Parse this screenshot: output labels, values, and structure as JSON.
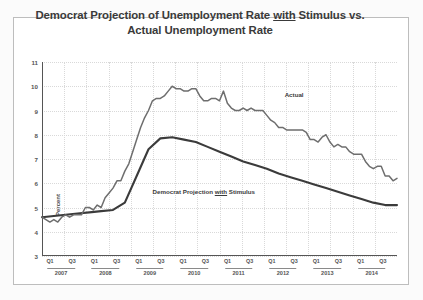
{
  "title_parts": {
    "before": "Democrat Projection of Unemployment Rate ",
    "underlined": "with",
    "after": " Stimulus vs.",
    "line2": "Actual Unemployment Rate"
  },
  "labels": {
    "actual": "Actual",
    "projection_before": "Democrat Projection ",
    "projection_underlined": "with",
    "projection_after": " Stimulus"
  },
  "colors": {
    "actual_line": "#6e6e6e",
    "projection_line": "#3b3b3b",
    "axis": "#555555",
    "grid": "#d9d9d9",
    "frame": "#bdbdbd",
    "title_text": "#3a3a3a",
    "page_background": "#fbfbfb",
    "plot_background": "#ffffff"
  },
  "chart_data": {
    "type": "line",
    "title": "Democrat Projection of Unemployment Rate with Stimulus vs. Actual Unemployment Rate",
    "xlabel": "",
    "ylabel": "Percent",
    "ylim": [
      3,
      11
    ],
    "yticks": [
      3,
      4,
      5,
      6,
      7,
      8,
      9,
      10,
      11
    ],
    "grid": true,
    "legend": "inline-annotations",
    "years": [
      "2007",
      "2008",
      "2009",
      "2010",
      "2011",
      "2012",
      "2013",
      "2014"
    ],
    "quarter_ticks": [
      "Q1",
      "Q3",
      "Q1",
      "Q3",
      "Q1",
      "Q3",
      "Q1",
      "Q3",
      "Q1",
      "Q3",
      "Q1",
      "Q3",
      "Q1",
      "Q3",
      "Q1",
      "Q3"
    ],
    "x": [
      "2007Q1",
      "2007Q2",
      "2007Q3",
      "2007Q4",
      "2008Q1",
      "2008Q2",
      "2008Q3",
      "2008Q4",
      "2009Q1",
      "2009Q2",
      "2009Q3",
      "2009Q4",
      "2010Q1",
      "2010Q2",
      "2010Q3",
      "2010Q4",
      "2011Q1",
      "2011Q2",
      "2011Q3",
      "2011Q4",
      "2012Q1",
      "2012Q2",
      "2012Q3",
      "2012Q4",
      "2013Q1",
      "2013Q2",
      "2013Q3",
      "2013Q4",
      "2014Q1",
      "2014Q2",
      "2014Q3"
    ],
    "series": [
      {
        "name": "Actual",
        "color": "#6e6e6e",
        "monthly_values": [
          4.6,
          4.5,
          4.4,
          4.5,
          4.4,
          4.6,
          4.7,
          4.6,
          4.7,
          4.7,
          4.7,
          5.0,
          5.0,
          4.9,
          5.1,
          5.0,
          5.4,
          5.6,
          5.8,
          6.1,
          6.1,
          6.5,
          6.8,
          7.3,
          7.8,
          8.3,
          8.7,
          9.0,
          9.4,
          9.5,
          9.5,
          9.6,
          9.8,
          10.0,
          9.9,
          9.9,
          9.8,
          9.8,
          9.9,
          9.9,
          9.6,
          9.4,
          9.4,
          9.5,
          9.5,
          9.4,
          9.8,
          9.3,
          9.1,
          9.0,
          9.0,
          9.1,
          9.0,
          9.1,
          9.0,
          9.0,
          9.0,
          8.8,
          8.6,
          8.5,
          8.3,
          8.3,
          8.2,
          8.2,
          8.2,
          8.2,
          8.2,
          8.1,
          7.8,
          7.8,
          7.7,
          7.9,
          8.0,
          7.7,
          7.5,
          7.6,
          7.5,
          7.5,
          7.3,
          7.2,
          7.2,
          7.2,
          6.9,
          6.7,
          6.6,
          6.7,
          6.7,
          6.3,
          6.3,
          6.1,
          6.2
        ]
      },
      {
        "name": "Democrat Projection with Stimulus",
        "color": "#3b3b3b",
        "quarterly_values": [
          4.6,
          4.65,
          4.7,
          4.75,
          4.8,
          4.85,
          4.9,
          5.2,
          6.3,
          7.4,
          7.85,
          7.9,
          7.8,
          7.7,
          7.5,
          7.3,
          7.1,
          6.9,
          6.75,
          6.6,
          6.4,
          6.25,
          6.1,
          5.95,
          5.8,
          5.65,
          5.5,
          5.35,
          5.2,
          5.1,
          5.1
        ]
      }
    ],
    "annotations": [
      {
        "text": "Actual",
        "x": "2012Q1",
        "y": 9.6
      },
      {
        "text": "Democrat Projection with Stimulus",
        "x": "2009Q2",
        "y": 5.6
      }
    ]
  }
}
